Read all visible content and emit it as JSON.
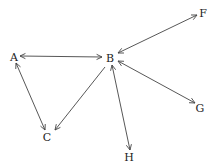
{
  "diagram": {
    "type": "directed-graph",
    "colors": {
      "edge": "#444444",
      "label": "#222222",
      "background": "#ffffff"
    },
    "nodes": [
      {
        "id": "A",
        "label": "A",
        "x": 14,
        "y": 61
      },
      {
        "id": "B",
        "label": "B",
        "x": 110,
        "y": 62
      },
      {
        "id": "F",
        "label": "F",
        "x": 203,
        "y": 17
      },
      {
        "id": "G",
        "label": "G",
        "x": 200,
        "y": 112
      },
      {
        "id": "C",
        "label": "C",
        "x": 47,
        "y": 141
      },
      {
        "id": "H",
        "label": "H",
        "x": 129,
        "y": 161
      }
    ],
    "edges": [
      {
        "from": "A",
        "to": "B",
        "x1": 20,
        "y1": 56,
        "x2": 102,
        "y2": 57,
        "arrow_start": true,
        "arrow_end": true
      },
      {
        "from": "B",
        "to": "F",
        "x1": 118,
        "y1": 53,
        "x2": 197,
        "y2": 15,
        "arrow_start": true,
        "arrow_end": true
      },
      {
        "from": "B",
        "to": "G",
        "x1": 118,
        "y1": 61,
        "x2": 195,
        "y2": 103,
        "arrow_start": true,
        "arrow_end": true
      },
      {
        "from": "B",
        "to": "C",
        "x1": 105,
        "y1": 67,
        "x2": 55,
        "y2": 130,
        "arrow_start": false,
        "arrow_end": true
      },
      {
        "from": "B",
        "to": "H",
        "x1": 112,
        "y1": 65,
        "x2": 130,
        "y2": 150,
        "arrow_start": true,
        "arrow_end": true
      },
      {
        "from": "A",
        "to": "C",
        "x1": 16,
        "y1": 63,
        "x2": 45,
        "y2": 130,
        "arrow_start": true,
        "arrow_end": true
      }
    ]
  }
}
